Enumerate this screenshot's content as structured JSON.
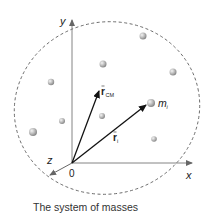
{
  "diagram": {
    "caption": "The system of masses",
    "axes": {
      "x_label": "x",
      "y_label": "y",
      "z_label": "z",
      "origin_label": "0"
    },
    "vectors": {
      "r_cm": {
        "symbol": "r",
        "subscript": "CM"
      },
      "r_i": {
        "symbol": "r",
        "subscript": "i"
      }
    },
    "mass_label": {
      "symbol": "m",
      "subscript": "i"
    },
    "boundary": "dashed ellipse enclosing system",
    "masses_count": 9,
    "colors": {
      "axis": "#777777",
      "vector": "#111111",
      "boundary": "#555555",
      "sphere": "#b5b5b5"
    }
  }
}
